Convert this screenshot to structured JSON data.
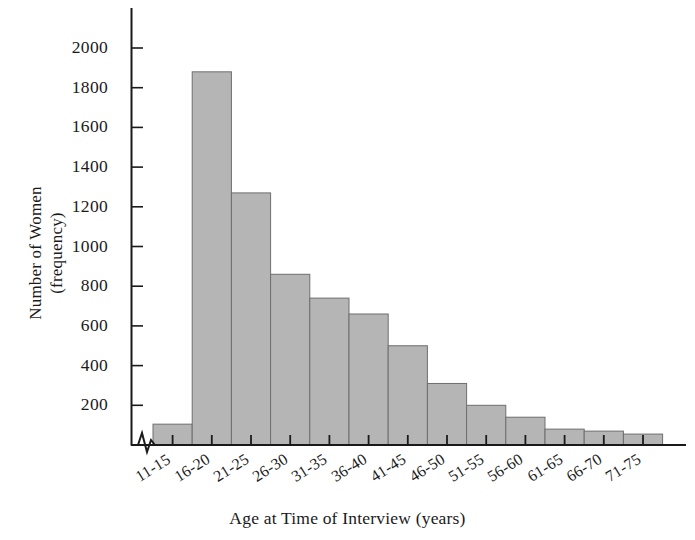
{
  "chart_data": {
    "type": "bar",
    "title": "",
    "subtitle": "",
    "xlabel": "Age at Time of Interview (years)",
    "ylabel_line1": "Number of Women",
    "ylabel_line2": "(frequency)",
    "ylabel": "Number of Women (frequency)",
    "categories": [
      "11-15",
      "16-20",
      "21-25",
      "26-30",
      "31-35",
      "36-40",
      "41-45",
      "46-50",
      "51-55",
      "56-60",
      "61-65",
      "66-70",
      "71-75"
    ],
    "values": [
      105,
      1880,
      1270,
      860,
      740,
      660,
      500,
      310,
      200,
      140,
      80,
      70,
      55
    ],
    "ytick_values": [
      200,
      400,
      600,
      800,
      1000,
      1200,
      1400,
      1600,
      1800,
      2000
    ],
    "ytick_labels": [
      "200",
      "400",
      "600",
      "800",
      "1000",
      "1200",
      "1400",
      "1600",
      "1800",
      "2000"
    ],
    "ylim": [
      0,
      2100
    ],
    "grid": false,
    "legend": "none",
    "bar_fill_color": "#b5b5b5",
    "bar_edge_color": "#6e6e6e",
    "axis_color": "#1a1a1a",
    "axis_break": "zigzag",
    "note": "Histogram of women's age at time of interview; y-axis has a break symbol near the origin."
  },
  "axes": {
    "y_axis_name": "frequency-axis",
    "x_axis_name": "age-group-axis"
  }
}
